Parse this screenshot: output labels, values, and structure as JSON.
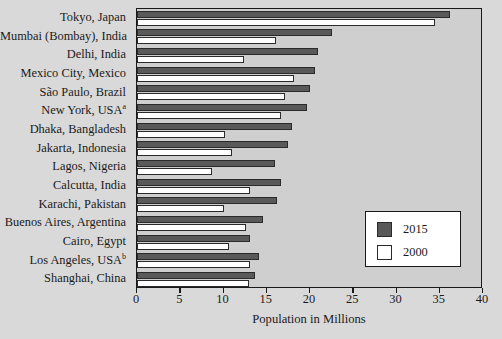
{
  "chart_data": {
    "type": "bar",
    "orientation": "horizontal",
    "title": "",
    "xlabel": "Population in Millions",
    "ylabel": "",
    "xlim": [
      0,
      40
    ],
    "xticks": [
      0,
      5,
      10,
      15,
      20,
      25,
      30,
      35,
      40
    ],
    "grid": false,
    "legend_position": "lower-right",
    "categories": [
      "Tokyo, Japan",
      "Mumbai (Bombay), India",
      "Delhi, India",
      "Mexico City, Mexico",
      "São Paulo, Brazil",
      "New York, USA",
      "Dhaka, Bangladesh",
      "Jakarta, Indonesia",
      "Lagos, Nigeria",
      "Calcutta, India",
      "Karachi, Pakistan",
      "Buenos Aires, Argentina",
      "Cairo, Egypt",
      "Los Angeles, USA",
      "Shanghai, China"
    ],
    "category_footnotes": [
      "",
      "",
      "",
      "",
      "",
      "a",
      "",
      "",
      "",
      "",
      "",
      "",
      "",
      "b",
      ""
    ],
    "series": [
      {
        "name": "2015",
        "color": "#595959",
        "values": [
          36.2,
          22.6,
          20.9,
          20.6,
          20.0,
          19.7,
          17.9,
          17.5,
          16.0,
          16.7,
          16.2,
          14.6,
          13.1,
          14.1,
          13.6
        ]
      },
      {
        "name": "2000",
        "color": "#ffffff",
        "values": [
          34.5,
          16.1,
          12.4,
          18.1,
          17.1,
          16.6,
          10.2,
          11.0,
          8.7,
          13.1,
          10.0,
          12.6,
          10.6,
          13.1,
          12.9
        ]
      }
    ]
  },
  "legend": {
    "entries": [
      {
        "label": "2015",
        "swatch": "#595959"
      },
      {
        "label": "2000",
        "swatch": "#ffffff"
      }
    ]
  },
  "axis": {
    "x_title": "Population in Millions",
    "tick_labels": [
      "0",
      "5",
      "10",
      "15",
      "20",
      "25",
      "30",
      "35",
      "40"
    ]
  },
  "colors": {
    "page_background": "#d9d9d9",
    "plot_background": "#cfcfcf",
    "bar_2015": "#595959",
    "bar_2000": "#ffffff",
    "outline": "#1a1a1a"
  }
}
